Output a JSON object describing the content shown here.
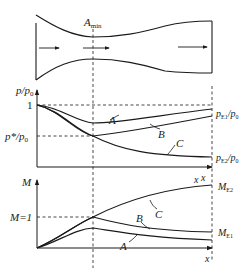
{
  "nozzle": {
    "throat_label": "A",
    "throat_subscript": "min",
    "flow_direction": "left-to-right"
  },
  "pressure_plot": {
    "y_axis_label_p": "p/p",
    "y_axis_label_sub": "0",
    "tick_one": "1",
    "tick_pstar": "p*/p",
    "tick_pstar_sub": "0",
    "x_axis_label": "x",
    "curve_labels": {
      "A": "A",
      "B": "B",
      "C": "C"
    },
    "right_label_E1": "p",
    "right_label_E1_sub": "E1",
    "right_label_E1_tail": "/p",
    "right_label_E1_tail_sub": "0",
    "right_label_E2": "p",
    "right_label_E2_sub": "E2",
    "right_label_E2_tail": "/p",
    "right_label_E2_tail_sub": "0"
  },
  "mach_plot": {
    "y_axis_label": "M",
    "tick_M1": "M=1",
    "x_axis_label": "x",
    "x_label_top": "x",
    "curve_labels": {
      "A": "A",
      "B": "B",
      "C": "C"
    },
    "right_label_E2": "M",
    "right_label_E2_sub": "E2",
    "right_label_E1": "M",
    "right_label_E1_sub": "E1"
  },
  "colors": {
    "line": "#1a1a1a",
    "background": "#ffffff"
  }
}
